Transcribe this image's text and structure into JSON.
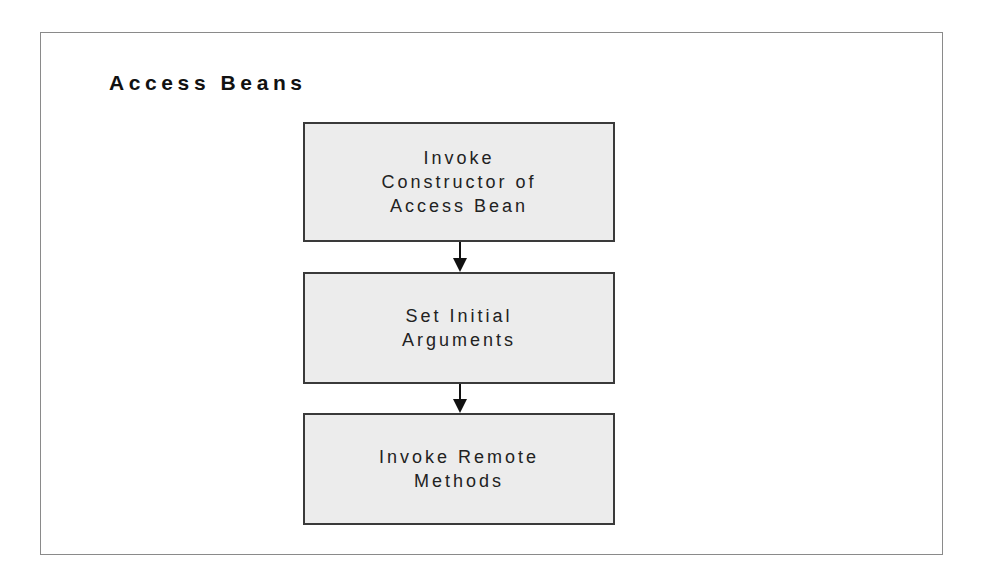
{
  "diagram": {
    "title": "Access Beans",
    "steps": [
      {
        "label": "Invoke\nConstructor of\nAccess Bean"
      },
      {
        "label": "Set Initial\nArguments"
      },
      {
        "label": "Invoke Remote\nMethods"
      }
    ],
    "connectors": [
      {
        "from": 0,
        "to": 1,
        "icon": "arrow-down-icon"
      },
      {
        "from": 1,
        "to": 2,
        "icon": "arrow-down-icon"
      }
    ],
    "colors": {
      "box_fill": "#ececec",
      "box_border": "#3a3a3a",
      "frame_border": "#8a8a8a",
      "text": "#222222"
    }
  }
}
